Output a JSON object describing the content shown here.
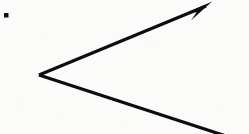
{
  "figure": {
    "description": "A hand-drawn style angle on scanned paper: a vertex at the left with two straight rays opening to the right. The upper ray terminates in a solid filled arrowhead at the top-right. The lower ray runs off the bottom-right edge.",
    "domain": "diagram",
    "canvas": {
      "width": 249,
      "height": 134
    },
    "background": {
      "name": "scanned-paper",
      "color": "#fbfbfa",
      "noise_color": "#ededea",
      "noise_opacity": 0.5
    },
    "ink": {
      "color": "#0d0d0d",
      "stroke_width": 3.2
    },
    "vertex": {
      "name": "angle-vertex",
      "x": 39,
      "y": 75,
      "label": ""
    },
    "rays": [
      {
        "name": "upper-ray-with-arrowhead",
        "from": {
          "x": 39,
          "y": 75
        },
        "to": {
          "x": 206,
          "y": 6
        },
        "has_arrowhead": true,
        "direction": "up-right",
        "angle_degrees": 22.4
      },
      {
        "name": "lower-ray",
        "from": {
          "x": 39,
          "y": 75
        },
        "to": {
          "x": 226,
          "y": 136
        },
        "has_arrowhead": false,
        "direction": "down-right",
        "angle_degrees": -18.1
      }
    ],
    "arrowhead": {
      "name": "arrowhead",
      "tip": {
        "x": 212,
        "y": 2
      },
      "points": "212,1.5 190,11.5 196.5,12.5 191,20.5",
      "fill": "#0d0d0d"
    },
    "marker_dot": {
      "name": "corner-dot-marker",
      "x": 4,
      "y": 13,
      "width": 4.5,
      "height": 4.5,
      "color": "#111111"
    },
    "speckles": [
      {
        "x": 43,
        "y": 38,
        "r": 2.6,
        "o": 0.1
      },
      {
        "x": 52,
        "y": 44,
        "r": 1.8,
        "o": 0.09
      },
      {
        "x": 152,
        "y": 46,
        "r": 3.4,
        "o": 0.1
      },
      {
        "x": 168,
        "y": 52,
        "r": 2.2,
        "o": 0.09
      },
      {
        "x": 182,
        "y": 58,
        "r": 2.8,
        "o": 0.08
      },
      {
        "x": 196,
        "y": 48,
        "r": 2.0,
        "o": 0.09
      },
      {
        "x": 213,
        "y": 44,
        "r": 2.4,
        "o": 0.08
      },
      {
        "x": 22,
        "y": 104,
        "r": 3.0,
        "o": 0.09
      },
      {
        "x": 36,
        "y": 112,
        "r": 2.2,
        "o": 0.08
      },
      {
        "x": 60,
        "y": 118,
        "r": 2.6,
        "o": 0.09
      },
      {
        "x": 84,
        "y": 110,
        "r": 2.0,
        "o": 0.08
      },
      {
        "x": 122,
        "y": 122,
        "r": 3.2,
        "o": 0.1
      },
      {
        "x": 146,
        "y": 116,
        "r": 2.4,
        "o": 0.09
      },
      {
        "x": 170,
        "y": 124,
        "r": 2.8,
        "o": 0.09
      },
      {
        "x": 196,
        "y": 118,
        "r": 2.2,
        "o": 0.08
      },
      {
        "x": 222,
        "y": 110,
        "r": 2.6,
        "o": 0.09
      },
      {
        "x": 236,
        "y": 96,
        "r": 2.0,
        "o": 0.07
      },
      {
        "x": 118,
        "y": 20,
        "r": 2.4,
        "o": 0.07
      },
      {
        "x": 232,
        "y": 14,
        "r": 2.8,
        "o": 0.08
      },
      {
        "x": 8,
        "y": 64,
        "r": 2.2,
        "o": 0.07
      }
    ]
  }
}
